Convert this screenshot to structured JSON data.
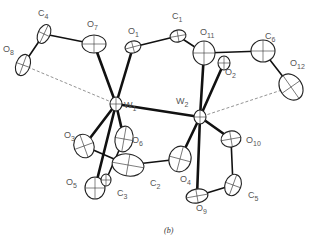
{
  "figure": {
    "caption": "(b)",
    "type": "ORTEP thermal-ellipsoid structure drawing",
    "atoms": [
      {
        "id": "W1",
        "element": "W",
        "sub": "1"
      },
      {
        "id": "W2",
        "element": "W",
        "sub": "2"
      },
      {
        "id": "O1",
        "element": "O",
        "sub": "1"
      },
      {
        "id": "O2",
        "element": "O",
        "sub": "2"
      },
      {
        "id": "O3",
        "element": "O",
        "sub": "3"
      },
      {
        "id": "O4",
        "element": "O",
        "sub": "4"
      },
      {
        "id": "O5",
        "element": "O",
        "sub": "5"
      },
      {
        "id": "O6",
        "element": "O",
        "sub": "6"
      },
      {
        "id": "O7",
        "element": "O",
        "sub": "7"
      },
      {
        "id": "O8",
        "element": "O",
        "sub": "8"
      },
      {
        "id": "O9",
        "element": "O",
        "sub": "9"
      },
      {
        "id": "O10",
        "element": "O",
        "sub": "10"
      },
      {
        "id": "O11",
        "element": "O",
        "sub": "11"
      },
      {
        "id": "O12",
        "element": "O",
        "sub": "12"
      },
      {
        "id": "C1",
        "element": "C",
        "sub": "1"
      },
      {
        "id": "C2",
        "element": "C",
        "sub": "2"
      },
      {
        "id": "C3",
        "element": "C",
        "sub": "3"
      },
      {
        "id": "C4",
        "element": "C",
        "sub": "4"
      },
      {
        "id": "C5",
        "element": "C",
        "sub": "5"
      },
      {
        "id": "C6",
        "element": "C",
        "sub": "6"
      }
    ],
    "bonds": [
      [
        "W1",
        "W2"
      ],
      [
        "W1",
        "O7"
      ],
      [
        "W1",
        "O1"
      ],
      [
        "W1",
        "O3"
      ],
      [
        "W1",
        "O6"
      ],
      [
        "W1",
        "O5"
      ],
      [
        "W2",
        "O11"
      ],
      [
        "W2",
        "O2"
      ],
      [
        "W2",
        "O4"
      ],
      [
        "W2",
        "O10"
      ],
      [
        "W2",
        "O9"
      ],
      [
        "C4",
        "O7"
      ],
      [
        "C4",
        "O8"
      ],
      [
        "O1",
        "C1"
      ],
      [
        "C1",
        "O11"
      ],
      [
        "O11",
        "C6"
      ],
      [
        "C6",
        "O12"
      ],
      [
        "O3",
        "C2"
      ],
      [
        "C2",
        "O4"
      ],
      [
        "O5",
        "C3"
      ],
      [
        "O6",
        "C3"
      ],
      [
        "O10",
        "C5"
      ],
      [
        "C5",
        "O9"
      ]
    ],
    "hydrogen_bonds": [
      [
        "O8",
        "W1"
      ],
      [
        "O12",
        "W2"
      ]
    ]
  }
}
